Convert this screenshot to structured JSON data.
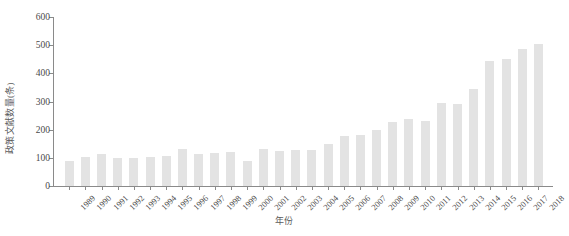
{
  "chart_data": {
    "type": "bar",
    "title": "",
    "subtitle": "",
    "xlabel": "年份",
    "ylabel": "政策文献数量(条)",
    "categories": [
      "1989",
      "1990",
      "1991",
      "1992",
      "1993",
      "1994",
      "1995",
      "1996",
      "1997",
      "1998",
      "1999",
      "2000",
      "2001",
      "2002",
      "2003",
      "2004",
      "2005",
      "2006",
      "2007",
      "2008",
      "2009",
      "2010",
      "2011",
      "2012",
      "2013",
      "2014",
      "2015",
      "2016",
      "2017",
      "2018"
    ],
    "values": [
      88,
      103,
      115,
      100,
      100,
      103,
      108,
      130,
      115,
      118,
      120,
      88,
      130,
      124,
      127,
      128,
      150,
      178,
      180,
      198,
      228,
      238,
      232,
      293,
      292,
      343,
      443,
      450,
      485,
      505
    ],
    "series": [
      {
        "name": "政策文献数量",
        "values": [
          88,
          103,
          115,
          100,
          100,
          103,
          108,
          130,
          115,
          118,
          120,
          88,
          130,
          124,
          127,
          128,
          150,
          178,
          180,
          198,
          228,
          238,
          232,
          293,
          292,
          343,
          443,
          450,
          485,
          505
        ]
      }
    ],
    "ylim": [
      0,
      600
    ],
    "yticks": [
      0,
      100,
      200,
      300,
      400,
      500,
      600
    ],
    "ytick_labels": [
      "0",
      "100",
      "200",
      "300",
      "400",
      "500",
      "600"
    ],
    "grid": false,
    "legend": false,
    "legend_position": "none",
    "bar_color": "#e3e3e3",
    "axis_color": "#8a8a8a",
    "text_color": "#4a4a4a"
  }
}
